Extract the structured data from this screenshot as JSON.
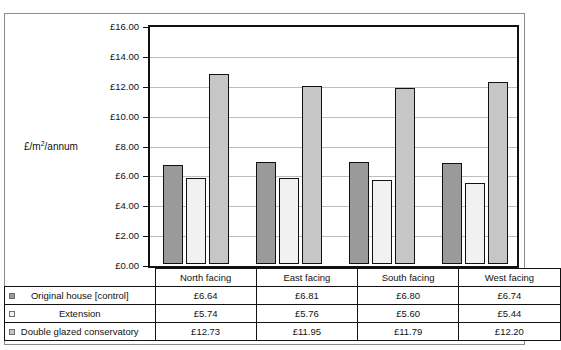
{
  "chart_data": {
    "type": "bar",
    "title": "",
    "xlabel": "",
    "ylabel": "£/m2/annum",
    "ylabel_base": "£/m",
    "ylabel_sup": "2",
    "ylabel_tail": "/annum",
    "ylim": [
      0,
      16
    ],
    "ytick_step": 2,
    "ytick_labels": [
      "£0.00",
      "£2.00",
      "£4.00",
      "£6.00",
      "£8.00",
      "£10.00",
      "£12.00",
      "£14.00",
      "£16.00"
    ],
    "ytick_values": [
      0,
      2,
      4,
      6,
      8,
      10,
      12,
      14,
      16
    ],
    "grid": true,
    "legend_position": "table-below",
    "categories": [
      "North facing",
      "East facing",
      "South facing",
      "West facing"
    ],
    "series": [
      {
        "name": "Original house [control]",
        "color": "#9a9a9a",
        "values": [
          6.64,
          6.81,
          6.8,
          6.74
        ],
        "labels": [
          "£6.64",
          "£6.81",
          "£6.80",
          "£6.74"
        ]
      },
      {
        "name": "Extension",
        "color": "#f1f1f1",
        "values": [
          5.74,
          5.76,
          5.6,
          5.44
        ],
        "labels": [
          "£5.74",
          "£5.76",
          "£5.60",
          "£5.44"
        ]
      },
      {
        "name": "Double glazed conservatory",
        "color": "#c6c6c6",
        "values": [
          12.73,
          11.95,
          11.79,
          12.2
        ],
        "labels": [
          "£12.73",
          "£11.95",
          "£11.79",
          "£12.20"
        ]
      }
    ]
  },
  "table": {
    "column_headers": [
      "North facing",
      "East facing",
      "South facing",
      "West facing"
    ],
    "rows": [
      {
        "label": "Original house [control]",
        "swatch": "series-0-swatch",
        "cells": [
          "£6.64",
          "£6.81",
          "£6.80",
          "£6.74"
        ]
      },
      {
        "label": "Extension",
        "swatch": "series-1-swatch",
        "cells": [
          "£5.74",
          "£5.76",
          "£5.60",
          "£5.44"
        ]
      },
      {
        "label": "Double glazed conservatory",
        "swatch": "series-2-swatch",
        "cells": [
          "£12.73",
          "£11.95",
          "£11.79",
          "£12.20"
        ]
      }
    ]
  }
}
